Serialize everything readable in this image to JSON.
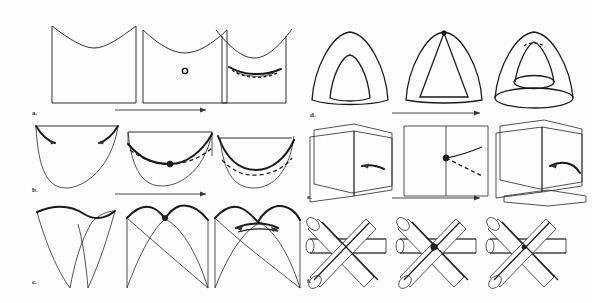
{
  "figure": {
    "background_color": "#fdfdfd",
    "ink_color": "#1a1a1a",
    "columns": 2,
    "rows_per_column": 3,
    "stages_per_row": 3,
    "stage_meaning": [
      "initial singular state",
      "critical / degenerate state",
      "deformed / resolved state"
    ],
    "arrow_direction": "left-to-right",
    "arrow_count": 6
  },
  "panels": [
    {
      "id": "a",
      "label": "a.",
      "column": "left",
      "row": 1,
      "caption_position": "bottom-left",
      "description": "square sheet with concave upper edge; a point appears, then opens into a short lens-shaped slit",
      "stages": [
        {
          "index": 1,
          "feature": "smooth dipped sheet",
          "marker": "none"
        },
        {
          "index": 2,
          "feature": "isolated point on sheet",
          "marker": "small-circle"
        },
        {
          "index": 3,
          "feature": "lens-shaped opening",
          "marker": "dashed-lens"
        }
      ]
    },
    {
      "id": "b",
      "label": "b.",
      "column": "left",
      "row": 2,
      "caption_position": "bottom-left",
      "description": "parabolic U-shaped curve meeting a horizontal chord; contact point becomes a node then a dashed arc",
      "stages": [
        {
          "index": 1,
          "feature": "deep U curve with arrowed tangents",
          "marker": "none"
        },
        {
          "index": 2,
          "feature": "tangential contact point",
          "marker": "filled-node"
        },
        {
          "index": 3,
          "feature": "separated branches",
          "marker": "dashed-arc"
        }
      ]
    },
    {
      "id": "c",
      "label": "c.",
      "column": "left",
      "row": 3,
      "caption_position": "bottom-left",
      "description": "downward cusp pair; the cusp meets, pinches at a node, then crosses into a beak-to-beak transition",
      "stages": [
        {
          "index": 1,
          "feature": "single deep cusp",
          "marker": "none"
        },
        {
          "index": 2,
          "feature": "double cusp with node at top",
          "marker": "filled-node"
        },
        {
          "index": 3,
          "feature": "crossed cusps with lens",
          "marker": "dashed-lens"
        }
      ]
    },
    {
      "id": "d",
      "label": "d.",
      "column": "right",
      "row": 1,
      "caption_position": "bottom-left",
      "description": "nested tent-shaped shell contracting to an apex, then opening as a cone over a circular base",
      "stages": [
        {
          "index": 1,
          "feature": "nested tent shells",
          "marker": "none"
        },
        {
          "index": 2,
          "feature": "shells meeting at apex",
          "marker": "apex-point"
        },
        {
          "index": 3,
          "feature": "cone with elliptical base",
          "marker": "dashed-apex"
        }
      ]
    },
    {
      "id": "e",
      "label": "e.",
      "column": "right",
      "row": 2,
      "caption_position": "bottom-left",
      "description": "two plane sheets approaching, meeting along a line through a node, then separating again",
      "stages": [
        {
          "index": 1,
          "feature": "separated skew sheets",
          "marker": "none"
        },
        {
          "index": 2,
          "feature": "sheets intersecting in a line",
          "marker": "filled-node"
        },
        {
          "index": 3,
          "feature": "re-separated sheets",
          "marker": "none"
        }
      ]
    },
    {
      "id": "f",
      "label": "f.",
      "column": "right",
      "row": 3,
      "caption_position": "bottom-left",
      "description": "three cylinders crossing; the common intersection tightens to a single triple point then loosens",
      "stages": [
        {
          "index": 1,
          "feature": "three cylinders in general position",
          "marker": "none"
        },
        {
          "index": 2,
          "feature": "triple point coincidence",
          "marker": "filled-node"
        },
        {
          "index": 3,
          "feature": "perturbed triple crossing",
          "marker": "small-node"
        }
      ]
    }
  ],
  "arrows": [
    {
      "id": "arrow-a-b",
      "after_panel": "a",
      "direction": "right"
    },
    {
      "id": "arrow-b-c",
      "after_panel": "b",
      "direction": "right"
    },
    {
      "id": "arrow-d-e",
      "after_panel": "d",
      "direction": "right"
    },
    {
      "id": "arrow-e-f",
      "after_panel": "e",
      "direction": "right"
    }
  ]
}
